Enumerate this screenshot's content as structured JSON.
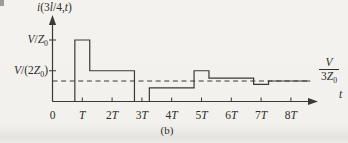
{
  "figure": {
    "title": "i(3l/4,t)",
    "caption": "(b)",
    "x_axis_symbol": "t",
    "asymptote_fraction": {
      "numerator": "V",
      "denominator": "3Z0"
    }
  },
  "colors": {
    "line": "#3a3936",
    "background": "#f2f1ed",
    "text": "#2e2d2b"
  },
  "chart_data": {
    "type": "line",
    "subtype": "step-waveform",
    "title": "i(3l/4,t)",
    "xlabel": "t",
    "ylabel": "i(3l/4,t)",
    "x_unit": "T",
    "y_unit": "V/Z0",
    "xlim": [
      0,
      8.8
    ],
    "ylim": [
      0,
      1.15
    ],
    "grid": false,
    "segments": [
      {
        "t1": 0,
        "t2": 0.75,
        "level": 0
      },
      {
        "t1": 0.75,
        "t2": 1.25,
        "level": 1
      },
      {
        "t1": 1.25,
        "t2": 2.75,
        "level": 0.5
      },
      {
        "t1": 2.75,
        "t2": 3.25,
        "level": 0
      },
      {
        "t1": 3.25,
        "t2": 4.75,
        "level": 0.22
      },
      {
        "t1": 4.75,
        "t2": 5.25,
        "level": 0.5
      },
      {
        "t1": 5.25,
        "t2": 6.75,
        "level": 0.38
      },
      {
        "t1": 6.75,
        "t2": 7.25,
        "level": 0.28
      },
      {
        "t1": 7.25,
        "t2": 8.65,
        "level": 0.333
      }
    ],
    "dashed_asymptote_level": 0.333,
    "asymptote_label": "V/3Z0",
    "x_ticks": [
      {
        "t": 0,
        "label": "0"
      },
      {
        "t": 1,
        "label": "T"
      },
      {
        "t": 2,
        "label": "2T"
      },
      {
        "t": 3,
        "label": "3T"
      },
      {
        "t": 4,
        "label": "4T"
      },
      {
        "t": 5,
        "label": "5T"
      },
      {
        "t": 6,
        "label": "6T"
      },
      {
        "t": 7,
        "label": "7T"
      },
      {
        "t": 8,
        "label": "8T"
      }
    ],
    "y_ticks": [
      {
        "v": 1,
        "label": "V/Z0"
      },
      {
        "v": 0.5,
        "label": "V/(2Z0)"
      }
    ]
  }
}
